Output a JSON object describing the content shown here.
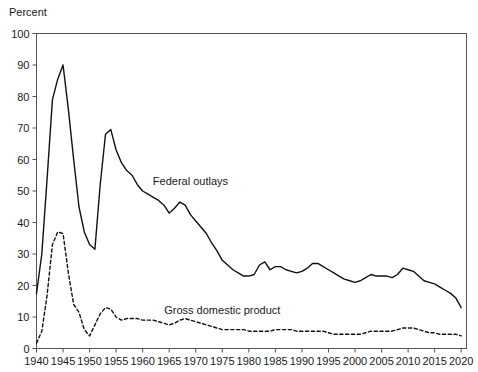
{
  "chart_data": {
    "type": "line",
    "title": "",
    "subtitle": "",
    "xlabel": "",
    "ylabel": "Percent",
    "unit_label": "Percent",
    "grid": false,
    "legend_position": "inline-annotation",
    "xlim": [
      1940,
      2021
    ],
    "ylim": [
      0,
      100
    ],
    "ytick_step": 10,
    "xtick_step": 5,
    "xticks": [
      1940,
      1945,
      1950,
      1955,
      1960,
      1965,
      1970,
      1975,
      1980,
      1985,
      1990,
      1995,
      2000,
      2005,
      2010,
      2015,
      2020
    ],
    "yticks": [
      0,
      10,
      20,
      30,
      40,
      50,
      60,
      70,
      80,
      90,
      100
    ],
    "line_color": "#111111",
    "axis_color": "#555555",
    "series": [
      {
        "name": "Federal outlays",
        "style": "solid",
        "annotation": "Federal outlays",
        "annotation_x": 1969,
        "annotation_y": 52,
        "x": [
          1940,
          1941,
          1942,
          1943,
          1944,
          1945,
          1946,
          1947,
          1948,
          1949,
          1950,
          1951,
          1952,
          1953,
          1954,
          1955,
          1956,
          1957,
          1958,
          1959,
          1960,
          1961,
          1962,
          1963,
          1964,
          1965,
          1966,
          1967,
          1968,
          1969,
          1970,
          1971,
          1972,
          1973,
          1974,
          1975,
          1976,
          1977,
          1978,
          1979,
          1980,
          1981,
          1982,
          1983,
          1984,
          1985,
          1986,
          1987,
          1988,
          1989,
          1990,
          1991,
          1992,
          1993,
          1994,
          1995,
          1996,
          1997,
          1998,
          1999,
          2000,
          2001,
          2002,
          2003,
          2004,
          2005,
          2006,
          2007,
          2008,
          2009,
          2010,
          2011,
          2012,
          2013,
          2014,
          2015,
          2016,
          2017,
          2018,
          2019,
          2020
        ],
        "y": [
          17.4,
          30.0,
          54.0,
          79.0,
          85.5,
          90.0,
          76.0,
          60.0,
          45.0,
          37.0,
          33.0,
          31.5,
          52.0,
          68.0,
          69.5,
          63.0,
          59.0,
          56.5,
          55.0,
          52.0,
          50.0,
          49.0,
          48.0,
          47.0,
          45.5,
          43.0,
          44.5,
          46.5,
          45.5,
          42.5,
          40.5,
          38.5,
          36.5,
          33.5,
          31.0,
          28.0,
          26.5,
          25.0,
          24.0,
          23.0,
          23.0,
          23.5,
          26.5,
          27.5,
          25.0,
          26.0,
          26.0,
          25.0,
          24.5,
          24.0,
          24.5,
          25.5,
          27.0,
          27.0,
          26.0,
          25.0,
          24.0,
          23.0,
          22.0,
          21.5,
          21.0,
          21.5,
          22.5,
          23.5,
          23.0,
          23.0,
          23.0,
          22.5,
          23.5,
          25.5,
          25.0,
          24.5,
          23.0,
          21.5,
          21.0,
          20.5,
          19.5,
          18.5,
          17.5,
          16.0,
          13.0
        ],
        "notes": "WWII peak ~90 (1945), Korean War peak ~69.5 (1954), decline to ~13 (2020)"
      },
      {
        "name": "Gross domestic product",
        "style": "dashed",
        "annotation": "Gross domestic product",
        "annotation_x": 1975,
        "annotation_y": 11,
        "x": [
          1940,
          1941,
          1942,
          1943,
          1944,
          1945,
          1946,
          1947,
          1948,
          1949,
          1950,
          1951,
          1952,
          1953,
          1954,
          1955,
          1956,
          1957,
          1958,
          1959,
          1960,
          1961,
          1962,
          1963,
          1964,
          1965,
          1966,
          1967,
          1968,
          1969,
          1970,
          1971,
          1972,
          1973,
          1974,
          1975,
          1976,
          1977,
          1978,
          1979,
          1980,
          1981,
          1982,
          1983,
          1984,
          1985,
          1986,
          1987,
          1988,
          1989,
          1990,
          1991,
          1992,
          1993,
          1994,
          1995,
          1996,
          1997,
          1998,
          1999,
          2000,
          2001,
          2002,
          2003,
          2004,
          2005,
          2006,
          2007,
          2008,
          2009,
          2010,
          2011,
          2012,
          2013,
          2014,
          2015,
          2016,
          2017,
          2018,
          2019,
          2020
        ],
        "y": [
          1.7,
          5.5,
          17.0,
          33.0,
          37.0,
          36.5,
          24.0,
          14.0,
          11.5,
          6.0,
          4.0,
          7.5,
          11.0,
          13.0,
          12.5,
          10.0,
          9.0,
          9.5,
          9.5,
          9.5,
          9.0,
          9.0,
          9.0,
          8.5,
          8.0,
          7.5,
          8.0,
          9.0,
          9.5,
          9.0,
          8.5,
          8.0,
          7.5,
          7.0,
          6.5,
          6.0,
          6.0,
          6.0,
          6.0,
          6.0,
          5.5,
          5.5,
          5.5,
          5.5,
          5.5,
          6.0,
          6.0,
          6.0,
          6.0,
          5.5,
          5.5,
          5.5,
          5.5,
          5.5,
          5.5,
          5.0,
          4.5,
          4.5,
          4.5,
          4.5,
          4.5,
          4.5,
          5.0,
          5.5,
          5.5,
          5.5,
          5.5,
          5.5,
          6.0,
          6.5,
          6.5,
          6.5,
          6.0,
          5.5,
          5.0,
          5.0,
          4.5,
          4.5,
          4.5,
          4.5,
          4.0
        ],
        "notes": "WWII peak ~37 (1944), Korean War bump ~13 (1953), stable 4-9 thereafter"
      }
    ]
  }
}
